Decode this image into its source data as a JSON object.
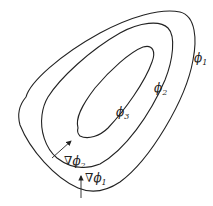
{
  "figure": {
    "type": "level-set contours with gradient vectors",
    "contours": [
      {
        "name": "phi1",
        "symbol": "ϕ",
        "subscript": "1"
      },
      {
        "name": "phi2",
        "symbol": "ϕ",
        "subscript": "2"
      },
      {
        "name": "phi3",
        "symbol": "ϕ",
        "subscript": "3"
      }
    ],
    "gradients": [
      {
        "name": "grad-phi2",
        "nabla": "∇ϕ",
        "subscript": "2"
      },
      {
        "name": "grad-phi1",
        "nabla": "∇ϕ",
        "subscript": "1"
      }
    ],
    "colors": {
      "stroke": "#222222",
      "background": "#ffffff"
    }
  }
}
